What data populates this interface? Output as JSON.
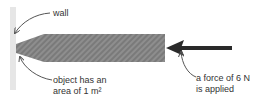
{
  "labels": {
    "wall": "wall",
    "object_line1": "object has an",
    "object_line2": "area of 1 m²",
    "force_line1": "a force of 6 N",
    "force_line2": "is applied"
  },
  "colors": {
    "wall": "#e6e6e6",
    "object": "#8c8c8c",
    "arrow": "#2a2a2a",
    "leader": "#555555"
  }
}
